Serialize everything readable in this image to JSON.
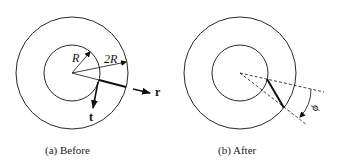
{
  "panels": [
    {
      "id": "a",
      "caption": "(a)  Before",
      "labels": {
        "inner_radius": "R",
        "outer_radius": "2R",
        "radial_vector": "r",
        "tangential_vector": "t"
      }
    },
    {
      "id": "b",
      "caption": "(b)  After",
      "labels": {
        "angle": "ϕ"
      }
    }
  ],
  "colors": {
    "stroke": "#111111",
    "background": "#ffffff"
  }
}
